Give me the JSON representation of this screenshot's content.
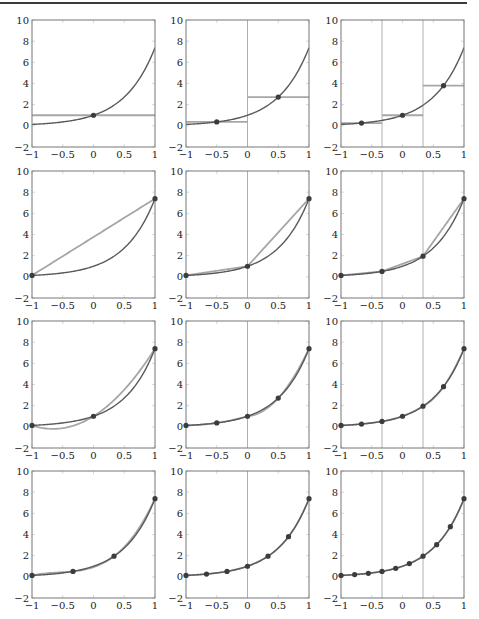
{
  "figure": {
    "colors": {
      "frame": "#777777",
      "function_curve": "#5a5a5a",
      "approximation": "#a6a6a6",
      "interval_line": "#b0b0b0",
      "node_point": "#3c3c3c",
      "tick": "#cfcfcf"
    }
  },
  "chart_data": {
    "type": "line",
    "function": "exp(2x)",
    "layout": {
      "rows": 4,
      "cols": 3,
      "grid": false,
      "legend": "none"
    },
    "xlim": [
      -1,
      1
    ],
    "ylim": [
      -2,
      10
    ],
    "xticks": [
      -1,
      -0.5,
      0,
      0.5,
      1
    ],
    "xtick_labels": [
      "−1",
      "−0.5",
      "0",
      "0.5",
      "1"
    ],
    "yticks": [
      -2,
      0,
      2,
      4,
      6,
      8,
      10
    ],
    "ytick_labels": [
      "−2",
      "0",
      "2",
      "4",
      "6",
      "8",
      "10"
    ],
    "panels": [
      {
        "row": 0,
        "col": 0,
        "degree": 0,
        "intervals": 1,
        "breaks": [
          -1,
          1
        ],
        "nodes": [
          0
        ],
        "node_values": [
          1.0
        ]
      },
      {
        "row": 0,
        "col": 1,
        "degree": 0,
        "intervals": 2,
        "breaks": [
          -1,
          0,
          1
        ],
        "nodes": [
          -0.5,
          0.5
        ],
        "node_values": [
          0.368,
          2.718
        ]
      },
      {
        "row": 0,
        "col": 2,
        "degree": 0,
        "intervals": 3,
        "breaks": [
          -1,
          -0.3333,
          0.3333,
          1
        ],
        "nodes": [
          -0.6667,
          0,
          0.6667
        ],
        "node_values": [
          0.264,
          1.0,
          3.794
        ]
      },
      {
        "row": 1,
        "col": 0,
        "degree": 1,
        "intervals": 1,
        "breaks": [
          -1,
          1
        ],
        "nodes": [
          -1,
          1
        ],
        "node_values": [
          0.135,
          7.389
        ]
      },
      {
        "row": 1,
        "col": 1,
        "degree": 1,
        "intervals": 2,
        "breaks": [
          -1,
          0,
          1
        ],
        "nodes": [
          -1,
          0,
          1
        ],
        "node_values": [
          0.135,
          1.0,
          7.389
        ]
      },
      {
        "row": 1,
        "col": 2,
        "degree": 1,
        "intervals": 3,
        "breaks": [
          -1,
          -0.3333,
          0.3333,
          1
        ],
        "nodes": [
          -1,
          -0.3333,
          0.3333,
          1
        ],
        "node_values": [
          0.135,
          0.513,
          1.948,
          7.389
        ]
      },
      {
        "row": 2,
        "col": 0,
        "degree": 2,
        "intervals": 1,
        "breaks": [
          -1,
          1
        ],
        "nodes": [
          -1,
          0,
          1
        ],
        "node_values": [
          0.135,
          1.0,
          7.389
        ]
      },
      {
        "row": 2,
        "col": 1,
        "degree": 2,
        "intervals": 2,
        "breaks": [
          -1,
          0,
          1
        ],
        "nodes": [
          -1,
          -0.5,
          0,
          0.5,
          1
        ],
        "node_values": [
          0.135,
          0.368,
          1.0,
          2.718,
          7.389
        ]
      },
      {
        "row": 2,
        "col": 2,
        "degree": 2,
        "intervals": 3,
        "breaks": [
          -1,
          -0.3333,
          0.3333,
          1
        ],
        "nodes": [
          -1,
          -0.6667,
          -0.3333,
          0,
          0.3333,
          0.6667,
          1
        ],
        "node_values": [
          0.135,
          0.264,
          0.513,
          1.0,
          1.948,
          3.794,
          7.389
        ]
      },
      {
        "row": 3,
        "col": 0,
        "degree": 3,
        "intervals": 1,
        "breaks": [
          -1,
          1
        ],
        "nodes": [
          -1,
          -0.3333,
          0.3333,
          1
        ],
        "node_values": [
          0.135,
          0.513,
          1.948,
          7.389
        ]
      },
      {
        "row": 3,
        "col": 1,
        "degree": 3,
        "intervals": 2,
        "breaks": [
          -1,
          0,
          1
        ],
        "nodes": [
          -1,
          -0.6667,
          -0.3333,
          0,
          0.3333,
          0.6667,
          1
        ],
        "node_values": [
          0.135,
          0.264,
          0.513,
          1.0,
          1.948,
          3.794,
          7.389
        ]
      },
      {
        "row": 3,
        "col": 2,
        "degree": 3,
        "intervals": 3,
        "breaks": [
          -1,
          -0.3333,
          0.3333,
          1
        ],
        "nodes": [
          -1,
          -0.7778,
          -0.5556,
          -0.3333,
          -0.1111,
          0.1111,
          0.3333,
          0.5556,
          0.7778,
          1
        ],
        "node_values": [
          0.135,
          0.211,
          0.329,
          0.513,
          0.801,
          1.249,
          1.948,
          3.038,
          4.739,
          7.389
        ]
      }
    ]
  },
  "geometry": {
    "panel_left": [
      32,
      186,
      341
    ],
    "panel_top": [
      20,
      171,
      321,
      471
    ],
    "panel_width": 123,
    "panel_height": 127
  }
}
